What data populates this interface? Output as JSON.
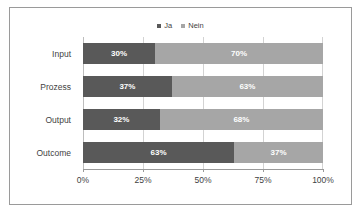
{
  "chart_data": {
    "type": "bar",
    "orientation": "horizontal",
    "stacked": "100%",
    "title": "",
    "xlabel": "",
    "ylabel": "",
    "xlim": [
      0,
      100
    ],
    "xticks": [
      "0%",
      "25%",
      "50%",
      "75%",
      "100%"
    ],
    "grid": true,
    "legend_position": "top-center",
    "categories": [
      "Input",
      "Prozess",
      "Output",
      "Outcome"
    ],
    "series": [
      {
        "name": "Ja",
        "color": "#595959",
        "values": [
          30,
          37,
          32,
          63
        ],
        "labels": [
          "30%",
          "37%",
          "32%",
          "63%"
        ]
      },
      {
        "name": "Nein",
        "color": "#A6A6A6",
        "values": [
          70,
          63,
          68,
          37
        ],
        "labels": [
          "70%",
          "63%",
          "68%",
          "37%"
        ]
      }
    ]
  },
  "legend": {
    "items": [
      {
        "label": "Ja",
        "color": "#595959"
      },
      {
        "label": "Nein",
        "color": "#A6A6A6"
      }
    ]
  },
  "axis": {
    "x_tick_labels": [
      "0%",
      "25%",
      "50%",
      "75%",
      "100%"
    ],
    "x_tick_positions": [
      0,
      25,
      50,
      75,
      100
    ]
  },
  "colors": {
    "series_ja": "#595959",
    "series_nein": "#A6A6A6",
    "gridline": "#d3d3d3",
    "axis": "#9a9a9a",
    "border": "#9a9a9a",
    "text": "#3f3f3f",
    "data_label": "#ffffff",
    "background": "#ffffff"
  }
}
